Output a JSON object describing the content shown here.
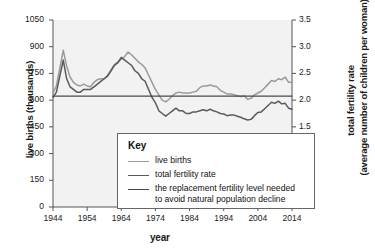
{
  "chart_data": {
    "type": "line",
    "title": "",
    "xlabel": "year",
    "ylabel": "live births (thousands)",
    "ylabel_right": "total fertility rate",
    "ylabel_right_sub": "(average number of children per woman)",
    "xlim": [
      1944,
      2014
    ],
    "ylim": [
      0,
      1050
    ],
    "ylim_right": [
      0,
      3.5
    ],
    "grid": false,
    "legend_position": "bottom-center",
    "legend_title": "Key",
    "xticks": [
      1944,
      1954,
      1964,
      1974,
      1984,
      1994,
      2004,
      2014
    ],
    "xtick_labels": [
      "1944",
      "1954",
      "1964",
      "1974",
      "1984",
      "1994",
      "2004",
      "2014"
    ],
    "yticks_left": [
      0,
      150,
      300,
      450,
      600,
      750,
      900,
      1050
    ],
    "ytick_labels_left": [
      "0",
      "150",
      "300",
      "450",
      "600",
      "750",
      "900",
      "1050"
    ],
    "yticks_right": [
      0,
      0.5,
      1.0,
      1.5,
      2.0,
      2.5,
      3.0,
      3.5
    ],
    "ytick_labels_right": [
      "0",
      "0.5",
      "1.0",
      "1.5",
      "2.0",
      "2.5",
      "3.0",
      "3.5"
    ],
    "series": [
      {
        "name": "live births",
        "axis": "left",
        "color": "#9a9a9a",
        "x": [
          1944,
          1945,
          1946,
          1947,
          1948,
          1949,
          1950,
          1951,
          1952,
          1953,
          1954,
          1955,
          1956,
          1957,
          1958,
          1959,
          1960,
          1961,
          1962,
          1963,
          1964,
          1965,
          1966,
          1967,
          1968,
          1969,
          1970,
          1971,
          1972,
          1973,
          1974,
          1975,
          1976,
          1977,
          1978,
          1979,
          1980,
          1981,
          1982,
          1983,
          1984,
          1985,
          1986,
          1987,
          1988,
          1989,
          1990,
          1991,
          1992,
          1993,
          1994,
          1995,
          1996,
          1997,
          1998,
          1999,
          2000,
          2001,
          2002,
          2003,
          2004,
          2005,
          2006,
          2007,
          2008,
          2009,
          2010,
          2011,
          2012,
          2013,
          2014
        ],
        "y": [
          640,
          680,
          780,
          880,
          790,
          730,
          700,
          685,
          680,
          690,
          680,
          675,
          700,
          715,
          720,
          720,
          740,
          770,
          800,
          815,
          830,
          845,
          870,
          855,
          835,
          815,
          800,
          780,
          740,
          700,
          660,
          630,
          600,
          590,
          605,
          625,
          640,
          645,
          640,
          640,
          640,
          645,
          650,
          670,
          680,
          680,
          685,
          680,
          675,
          655,
          645,
          635,
          635,
          630,
          625,
          620,
          625,
          605,
          610,
          630,
          640,
          650,
          670,
          690,
          710,
          705,
          720,
          715,
          730,
          700,
          700
        ]
      },
      {
        "name": "total fertility rate",
        "axis": "right",
        "color": "#5a5a5a",
        "x": [
          1944,
          1945,
          1946,
          1947,
          1948,
          1949,
          1950,
          1951,
          1952,
          1953,
          1954,
          1955,
          1956,
          1957,
          1958,
          1959,
          1960,
          1961,
          1962,
          1963,
          1964,
          1965,
          1966,
          1967,
          1968,
          1969,
          1970,
          1971,
          1972,
          1973,
          1974,
          1975,
          1976,
          1977,
          1978,
          1979,
          1980,
          1981,
          1982,
          1983,
          1984,
          1985,
          1986,
          1987,
          1988,
          1989,
          1990,
          1991,
          1992,
          1993,
          1994,
          1995,
          1996,
          1997,
          1998,
          1999,
          2000,
          2001,
          2002,
          2003,
          2004,
          2005,
          2006,
          2007,
          2008,
          2009,
          2010,
          2011,
          2012,
          2013,
          2014
        ],
        "y": [
          2.05,
          2.15,
          2.45,
          2.75,
          2.4,
          2.25,
          2.2,
          2.15,
          2.15,
          2.2,
          2.2,
          2.2,
          2.25,
          2.3,
          2.35,
          2.4,
          2.45,
          2.55,
          2.65,
          2.7,
          2.8,
          2.75,
          2.7,
          2.65,
          2.55,
          2.5,
          2.4,
          2.35,
          2.2,
          2.05,
          1.95,
          1.8,
          1.75,
          1.7,
          1.75,
          1.8,
          1.85,
          1.8,
          1.8,
          1.75,
          1.75,
          1.78,
          1.78,
          1.8,
          1.82,
          1.8,
          1.83,
          1.8,
          1.78,
          1.75,
          1.74,
          1.71,
          1.72,
          1.72,
          1.7,
          1.68,
          1.65,
          1.63,
          1.64,
          1.71,
          1.77,
          1.78,
          1.84,
          1.9,
          1.96,
          1.94,
          1.98,
          1.93,
          1.94,
          1.85,
          1.83
        ]
      },
      {
        "name": "the replacement fertility level needed to avoid natural population decline",
        "axis": "right",
        "color": "#4a4a4a",
        "constant_value": 2.075,
        "x": [
          1944,
          2014
        ],
        "y": [
          2.075,
          2.075
        ]
      }
    ],
    "legend_entries": [
      {
        "label": "live births",
        "color": "#9a9a9a"
      },
      {
        "label": "total fertility rate",
        "color": "#5a5a5a"
      },
      {
        "label": "the replacement fertility level needed",
        "label2": "to avoid natural population decline",
        "color": "#4a4a4a"
      }
    ]
  }
}
